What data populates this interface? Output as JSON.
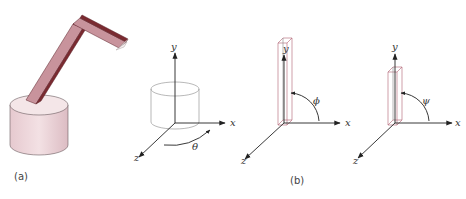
{
  "figure": {
    "panel_a": {
      "caption": "(a)",
      "description": "3D rendered robot arm: cylindrical base with two-segment bar arm",
      "colors": {
        "base": "#efd7dc",
        "arm_light": "#c89aa3",
        "arm_dark": "#7a2a30",
        "arm_end": "#f2e6e6"
      }
    },
    "panel_b": {
      "caption": "(b)",
      "diagrams": [
        {
          "id": "base-rotation",
          "axes": {
            "x": "x",
            "y": "y",
            "z": "z"
          },
          "angle": "θ",
          "object": "cylinder"
        },
        {
          "id": "lower-arm",
          "axes": {
            "x": "x",
            "y": "y",
            "z": "z"
          },
          "angle": "ϕ",
          "object": "tall bar"
        },
        {
          "id": "upper-arm",
          "axes": {
            "x": "x",
            "y": "y",
            "z": "z"
          },
          "angle": "ψ",
          "object": "short bar"
        }
      ]
    }
  }
}
